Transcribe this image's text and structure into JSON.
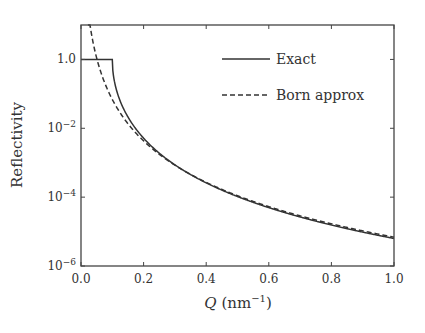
{
  "chart_data": {
    "type": "line",
    "title": "",
    "xlabel": "Q (nm⁻¹)",
    "xlabel_main": "Q",
    "xlabel_unit": "(nm",
    "xlabel_sup": "−1",
    "xlabel_close": ")",
    "ylabel": "Reflectivity",
    "xlim": [
      0.0,
      1.0
    ],
    "ylim": [
      1e-06,
      10
    ],
    "yscale": "log",
    "grid": false,
    "legend_position": "upper right",
    "x_ticks": [
      "0.0",
      "0.2",
      "0.4",
      "0.6",
      "0.8",
      "1.0"
    ],
    "y_ticks": [
      {
        "base": "1.0",
        "exp": ""
      },
      {
        "base": "10",
        "exp": "−2"
      },
      {
        "base": "10",
        "exp": "−4"
      },
      {
        "base": "10",
        "exp": "−6"
      }
    ],
    "critical_Q": 0.1,
    "series": [
      {
        "name": "Exact",
        "style": "solid",
        "x": [
          0.0,
          0.05,
          0.096,
          0.1,
          0.11,
          0.12,
          0.15,
          0.2,
          0.3,
          0.4,
          0.5,
          0.6,
          0.7,
          0.8,
          0.9,
          1.0
        ],
        "values": [
          1.0,
          1.0,
          1.0,
          0.55,
          0.12,
          0.05,
          0.0095,
          0.0021,
          0.00037,
          0.00011,
          4.4e-05,
          2.1e-05,
          1.15e-05,
          6.8e-06,
          4.2e-06,
          6.5e-06
        ]
      },
      {
        "name": "Born approx",
        "style": "dashed",
        "x": [
          0.022,
          0.03,
          0.05,
          0.1,
          0.15,
          0.2,
          0.3,
          0.4,
          0.5,
          0.6,
          0.7,
          0.8,
          0.9,
          1.0
        ],
        "values": [
          10.0,
          2.6,
          0.3,
          0.0195,
          0.0039,
          0.0012,
          0.00024,
          7.6e-05,
          3.1e-05,
          1.5e-05,
          8.1e-06,
          4.8e-06,
          3e-06,
          2e-06
        ]
      }
    ]
  },
  "legend": {
    "items": [
      {
        "label": "Exact",
        "style": "solid"
      },
      {
        "label": "Born approx",
        "style": "dashed"
      }
    ]
  }
}
